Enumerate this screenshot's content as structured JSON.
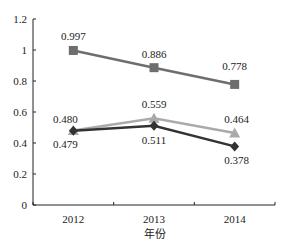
{
  "chart_data": {
    "type": "line",
    "title": "",
    "xlabel": "年份",
    "ylabel": "",
    "categories": [
      "2012",
      "2013",
      "2014"
    ],
    "ylim": [
      0,
      1.2
    ],
    "yticks": [
      "0",
      "0.2",
      "0.4",
      "0.6",
      "0.8",
      "1",
      "1.2"
    ],
    "grid": false,
    "legend": null,
    "series": [
      {
        "name": "series-square",
        "marker": "square",
        "color": "#6e6e6e",
        "values": [
          0.997,
          0.886,
          0.778
        ],
        "labels": [
          "0.997",
          "0.886",
          "0.778"
        ]
      },
      {
        "name": "series-triangle",
        "marker": "triangle",
        "color": "#aaaaaa",
        "values": [
          0.48,
          0.559,
          0.464
        ],
        "labels": [
          "0.480",
          "0.559",
          "0.464"
        ]
      },
      {
        "name": "series-diamond",
        "marker": "diamond",
        "color": "#333333",
        "values": [
          0.479,
          0.511,
          0.378
        ],
        "labels": [
          "0.479",
          "0.511",
          "0.378"
        ]
      }
    ]
  }
}
